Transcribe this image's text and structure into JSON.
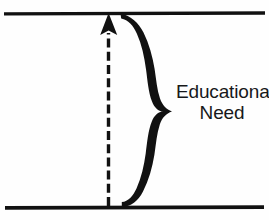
{
  "figure": {
    "background_color": "#fefefe",
    "ink_color": "#111111",
    "width": 269,
    "height": 220
  },
  "annotation": {
    "label_line_1": "Educational",
    "label_line_2": "Need",
    "label_full": "Educational Need",
    "text_color": "#17181a"
  },
  "elements": {
    "top_boundary_line": {
      "name": "upper-reference-line",
      "y": 12,
      "x_start": 4,
      "x_end": 265,
      "thickness": 4,
      "color": "#111111"
    },
    "bottom_boundary_line": {
      "name": "lower-reference-line",
      "y": 207,
      "x_start": 4,
      "x_end": 265,
      "thickness": 4,
      "color": "#111111"
    },
    "dashed_arrow": {
      "name": "vertical-dashed-arrow",
      "x": 108,
      "y_tail": 207,
      "y_head": 14,
      "dash_length": 9,
      "gap_length": 4,
      "thickness": 3,
      "arrowhead": "solid-triangle-up",
      "color": "#111111"
    },
    "curly_brace": {
      "name": "right-curly-brace",
      "orientation": "vertical-pointing-right",
      "x_top_tip": 120,
      "y_top_tip": 13,
      "x_bottom_tip": 122,
      "y_bottom_tip": 207,
      "x_mid_point": 172,
      "y_mid_point": 112,
      "x_bulge": 157,
      "style": "hand-drawn-calligraphic",
      "color": "#111111"
    }
  }
}
